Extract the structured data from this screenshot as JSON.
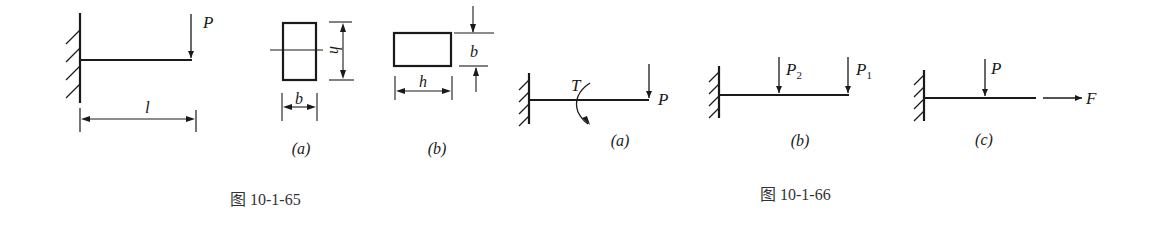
{
  "figure_65": {
    "caption": "图 10-1-65",
    "beam": {
      "load_label": "P",
      "length_label": "l"
    },
    "section_a": {
      "label": "(a)",
      "height_label": "h",
      "width_label": "b"
    },
    "section_b": {
      "label": "(b)",
      "width_label": "h",
      "height_label": "b"
    }
  },
  "figure_66": {
    "caption": "图 10-1-66",
    "case_a": {
      "label": "(a)",
      "torque_label": "T",
      "load_label": "P"
    },
    "case_b": {
      "label": "(b)",
      "load_2_label": "P",
      "load_2_sub": "2",
      "load_1_label": "P",
      "load_1_sub": "1"
    },
    "case_c": {
      "label": "(c)",
      "load_label": "P",
      "axial_label": "F"
    }
  }
}
